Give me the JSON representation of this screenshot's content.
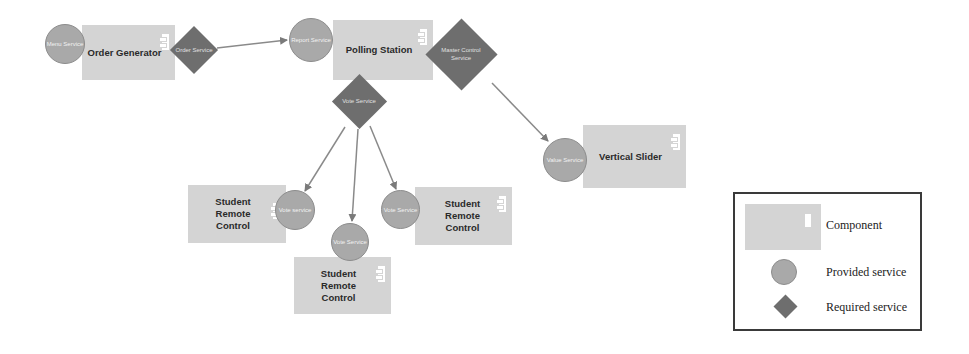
{
  "diagram": {
    "components": [
      {
        "id": "order-generator",
        "label": "Order Generator"
      },
      {
        "id": "polling-station",
        "label": "Polling Station"
      },
      {
        "id": "vertical-slider",
        "label": "Vertical Slider"
      },
      {
        "id": "student-remote-control-1",
        "label": "Student Remote Control"
      },
      {
        "id": "student-remote-control-2",
        "label": "Student Remote Control"
      },
      {
        "id": "student-remote-control-3",
        "label": "Student Remote Control"
      }
    ],
    "provided_services": [
      {
        "id": "menu-service",
        "label": "Menu Service",
        "component": "order-generator"
      },
      {
        "id": "report-service",
        "label": "Report Service",
        "component": "polling-station"
      },
      {
        "id": "value-service",
        "label": "Value Service",
        "component": "vertical-slider"
      },
      {
        "id": "vote-service-src1",
        "label": "Vote service",
        "component": "student-remote-control-1"
      },
      {
        "id": "vote-service-src2",
        "label": "Vote Service",
        "component": "student-remote-control-2"
      },
      {
        "id": "vote-service-src3",
        "label": "Vote Service",
        "component": "student-remote-control-3"
      }
    ],
    "required_services": [
      {
        "id": "order-service",
        "label": "Order Service",
        "component": "order-generator"
      },
      {
        "id": "master-control-service",
        "label": "Master Control Service",
        "component": "polling-station"
      },
      {
        "id": "vote-service-required",
        "label": "Vote Service",
        "component": "polling-station"
      }
    ],
    "connections": [
      {
        "from": "order-service",
        "to": "report-service"
      },
      {
        "from": "master-control-service",
        "to": "value-service"
      },
      {
        "from": "vote-service-required",
        "to": "vote-service-src1"
      },
      {
        "from": "vote-service-required",
        "to": "vote-service-src2"
      },
      {
        "from": "vote-service-required",
        "to": "vote-service-src3"
      }
    ]
  },
  "legend": {
    "component": "Component",
    "provided": "Provided service",
    "required": "Required service"
  },
  "colors": {
    "component_fill": "#d4d4d4",
    "provided_fill": "#a9a9a9",
    "required_fill": "#6e6e6e",
    "connector": "#8a8a8a"
  }
}
